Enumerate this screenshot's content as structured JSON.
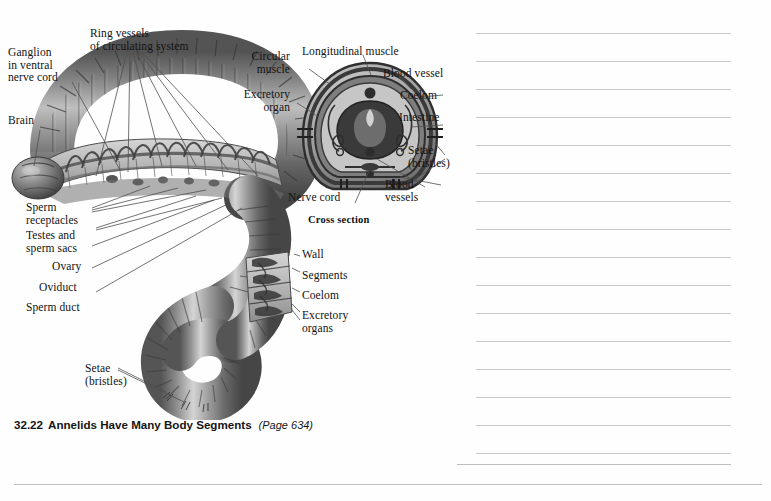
{
  "figure": {
    "caption": {
      "number": "32.22",
      "title": "Annelids Have Many Body Segments",
      "page_ref": "(Page 634)"
    },
    "cross_section_title": "Cross section",
    "labels_left": [
      {
        "id": "ganglion",
        "text": "Ganglion\nin ventral\nnerve cord"
      },
      {
        "id": "brain",
        "text": "Brain"
      },
      {
        "id": "sperm-receptacles",
        "text": "Sperm\nreceptacles"
      },
      {
        "id": "testes-sperm-sacs",
        "text": "Testes and\nsperm sacs"
      },
      {
        "id": "ovary",
        "text": "Ovary"
      },
      {
        "id": "oviduct",
        "text": "Oviduct"
      },
      {
        "id": "sperm-duct",
        "text": "Sperm duct"
      },
      {
        "id": "setae-bristles",
        "text": "Setae\n(bristles)"
      }
    ],
    "labels_top": [
      {
        "id": "ring-vessels",
        "text": "Ring vessels\nof circulating system"
      }
    ],
    "labels_cross_section": [
      {
        "id": "circular-muscle",
        "text": "Circular\nmuscle"
      },
      {
        "id": "excretory-organ",
        "text": "Excretory\norgan"
      },
      {
        "id": "longitudinal-muscle",
        "text": "Longitudinal muscle"
      },
      {
        "id": "blood-vessel",
        "text": "Blood vessel"
      },
      {
        "id": "coelom",
        "text": "Coelom"
      },
      {
        "id": "intestine",
        "text": "Intestine"
      },
      {
        "id": "setae-bristles-cs",
        "text": "Setae\n(bristles)"
      },
      {
        "id": "blood-vessels",
        "text": "Blood\nvessels"
      },
      {
        "id": "nerve-cord",
        "text": "Nerve cord"
      }
    ],
    "labels_mid_right": [
      {
        "id": "wall",
        "text": "Wall"
      },
      {
        "id": "segments",
        "text": "Segments"
      },
      {
        "id": "coelom-body",
        "text": "Coelom"
      },
      {
        "id": "excretory-organs",
        "text": "Excretory\norgans"
      }
    ],
    "colors": {
      "worm_dark": "#4a4a4a",
      "worm_mid": "#7d7d7d",
      "worm_light": "#b8b8b8",
      "worm_highlight": "#d9d9d9",
      "cutaway": "#c9c9c9",
      "label_text": "#121212",
      "leader_line": "#5a5a5a",
      "rule_line": "#c9c9cb",
      "page_background": "#fefefe"
    }
  },
  "notes": {
    "line_count": 17,
    "line_left": 476,
    "line_right": 731,
    "first_line_y": 33,
    "line_spacing": 28,
    "last_wide_line_y": 464
  }
}
